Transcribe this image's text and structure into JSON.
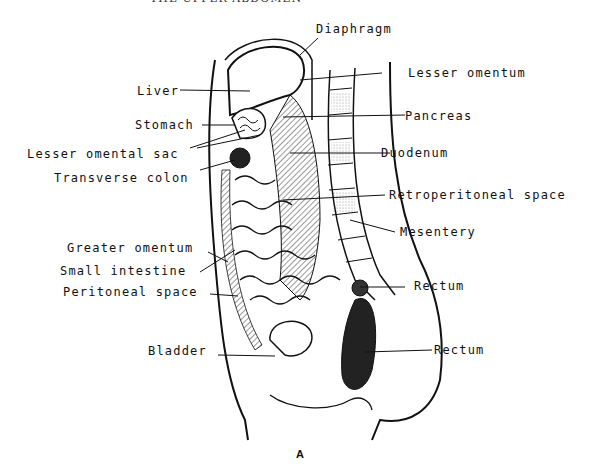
{
  "header": {
    "running_title": "THE UPPER ABDOMEN"
  },
  "figure": {
    "caption": "A",
    "labels_left": [
      {
        "id": "liver",
        "text": "Liver"
      },
      {
        "id": "stomach",
        "text": "Stomach"
      },
      {
        "id": "lesser-omental-sac",
        "text": "Lesser omental sac"
      },
      {
        "id": "transverse-colon",
        "text": "Transverse colon"
      },
      {
        "id": "greater-omentum",
        "text": "Greater omentum"
      },
      {
        "id": "small-intestine",
        "text": "Small intestine"
      },
      {
        "id": "peritoneal-space",
        "text": "Peritoneal space"
      },
      {
        "id": "bladder",
        "text": "Bladder"
      }
    ],
    "labels_right": [
      {
        "id": "diaphragm",
        "text": "Diaphragm"
      },
      {
        "id": "lesser-omentum",
        "text": "Lesser omentum"
      },
      {
        "id": "pancreas",
        "text": "Pancreas"
      },
      {
        "id": "duodenum",
        "text": "Duodenum"
      },
      {
        "id": "retroperitoneal-space",
        "text": "Retroperitoneal space"
      },
      {
        "id": "mesentery",
        "text": "Mesentery"
      },
      {
        "id": "rectum-upper",
        "text": "Rectum"
      },
      {
        "id": "rectum-lower",
        "text": "Rectum"
      }
    ]
  }
}
